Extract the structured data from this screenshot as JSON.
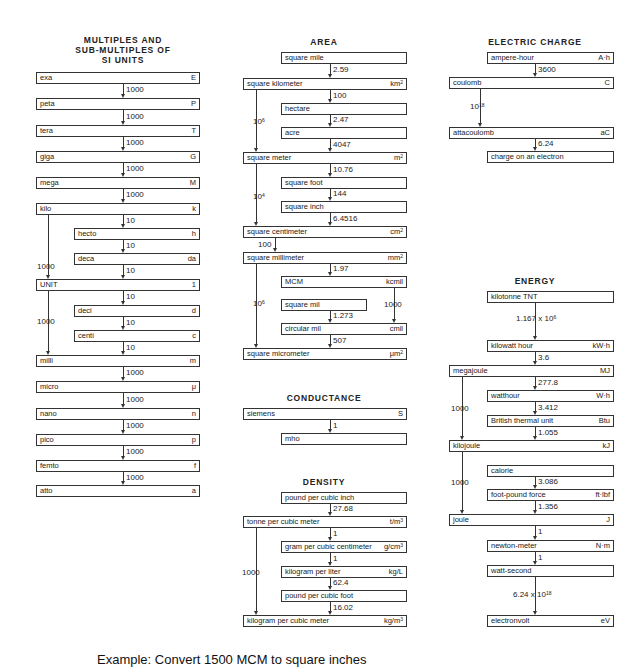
{
  "sections": {
    "si_prefixes": {
      "title_lines": [
        "MULTIPLES AND",
        "SUB-MULTIPLES OF",
        "SI UNITS"
      ],
      "units": [
        {
          "name": "exa",
          "symbol": "E"
        },
        {
          "name": "peta",
          "symbol": "P"
        },
        {
          "name": "tera",
          "symbol": "T"
        },
        {
          "name": "giga",
          "symbol": "G"
        },
        {
          "name": "mega",
          "symbol": "M"
        },
        {
          "name": "kilo",
          "symbol": "k"
        },
        {
          "name": "hecto",
          "symbol": "h"
        },
        {
          "name": "deca",
          "symbol": "da"
        },
        {
          "name": "UNIT",
          "symbol": "1"
        },
        {
          "name": "deci",
          "symbol": "d"
        },
        {
          "name": "centi",
          "symbol": "c"
        },
        {
          "name": "milli",
          "symbol": "m"
        },
        {
          "name": "micro",
          "symbol": "μ"
        },
        {
          "name": "nano",
          "symbol": "n"
        },
        {
          "name": "pico",
          "symbol": "p"
        },
        {
          "name": "femto",
          "symbol": "f"
        },
        {
          "name": "atto",
          "symbol": "a"
        }
      ],
      "factors": [
        "1000",
        "1000",
        "1000",
        "1000",
        "1000",
        "10",
        "10",
        "10",
        "10",
        "10",
        "10",
        "1000",
        "1000",
        "1000",
        "1000",
        "1000"
      ],
      "side_factors": [
        "1000",
        "1000"
      ]
    },
    "area": {
      "title": "AREA",
      "units": [
        {
          "name": "square mile",
          "symbol": ""
        },
        {
          "name": "square kilometer",
          "symbol": "km",
          "exp": "2"
        },
        {
          "name": "hectare",
          "symbol": ""
        },
        {
          "name": "acre",
          "symbol": ""
        },
        {
          "name": "square meter",
          "symbol": "m",
          "exp": "2"
        },
        {
          "name": "square foot",
          "symbol": ""
        },
        {
          "name": "square inch",
          "symbol": ""
        },
        {
          "name": "square centimeter",
          "symbol": "cm",
          "exp": "2"
        },
        {
          "name": "square millimeter",
          "symbol": "mm",
          "exp": "2"
        },
        {
          "name": "MCM",
          "symbol": "kcmil"
        },
        {
          "name": "square mil",
          "symbol": ""
        },
        {
          "name": "circular mil",
          "symbol": "cmil"
        },
        {
          "name": "square micrometer",
          "symbol": "μm",
          "exp": "2"
        }
      ],
      "factors": [
        "2.59",
        "100",
        "2.47",
        "4047",
        "10.76",
        "144",
        "6.4516",
        "100",
        "1.97",
        "1000",
        "1.273",
        "507"
      ],
      "side_factors": [
        {
          "base": "10",
          "exp": "6"
        },
        {
          "base": "10",
          "exp": "4"
        },
        {
          "base": "10",
          "exp": "6"
        }
      ]
    },
    "conductance": {
      "title": "CONDUCTANCE",
      "units": [
        {
          "name": "siemens",
          "symbol": "S"
        },
        {
          "name": "mho",
          "symbol": ""
        }
      ],
      "factors": [
        "1"
      ]
    },
    "density": {
      "title": "DENSITY",
      "units": [
        {
          "name": "pound per cubic inch",
          "symbol": ""
        },
        {
          "name": "tonne per cubic meter",
          "symbol": "t/m",
          "exp": "3"
        },
        {
          "name": "gram per cubic centimeter",
          "symbol": "g/cm",
          "exp": "3"
        },
        {
          "name": "kilogram per liter",
          "symbol": "kg/L"
        },
        {
          "name": "pound per cubic foot",
          "symbol": ""
        },
        {
          "name": "kilogram per cubic meter",
          "symbol": "kg/m",
          "exp": "3"
        }
      ],
      "factors": [
        "27.68",
        "1",
        "1",
        "62.4",
        "16.02"
      ],
      "side_factors": [
        "1000"
      ]
    },
    "electric_charge": {
      "title": "ELECTRIC CHARGE",
      "units": [
        {
          "name": "ampere-hour",
          "symbol": "A·h"
        },
        {
          "name": "coulomb",
          "symbol": "C"
        },
        {
          "name": "attacoulomb",
          "symbol": "aC"
        },
        {
          "name": "charge on an electron",
          "symbol": ""
        }
      ],
      "factors": [
        "3600",
        "6.24"
      ],
      "side_factors": [
        {
          "base": "10",
          "exp": "18"
        }
      ]
    },
    "energy": {
      "title": "ENERGY",
      "units": [
        {
          "name": "kilotonne  TNT",
          "symbol": ""
        },
        {
          "name": "kilowatt hour",
          "symbol": "kW·h"
        },
        {
          "name": "megajoule",
          "symbol": "MJ"
        },
        {
          "name": "watthour",
          "symbol": "W·h"
        },
        {
          "name": "British thermal unit",
          "symbol": "Btu"
        },
        {
          "name": "kilojoule",
          "symbol": "kJ"
        },
        {
          "name": "calorie",
          "symbol": ""
        },
        {
          "name": "foot-pound force",
          "symbol": "ft·lbf"
        },
        {
          "name": "joule",
          "symbol": "J"
        },
        {
          "name": "newton-meter",
          "symbol": "N·m"
        },
        {
          "name": "watt-second",
          "symbol": ""
        },
        {
          "name": "electronvolt",
          "symbol": "eV"
        }
      ],
      "factors": [
        {
          "base": "1.167 x 10",
          "exp": "6"
        },
        "3.6",
        "277.8",
        "3.412",
        "1.055",
        "3.086",
        "1.356",
        "1",
        "1",
        {
          "base": "6.24 x 10",
          "exp": "18"
        }
      ],
      "side_factors": [
        "1000",
        "1000"
      ]
    }
  },
  "caption": "Example:  Convert 1500 MCM to square inches"
}
